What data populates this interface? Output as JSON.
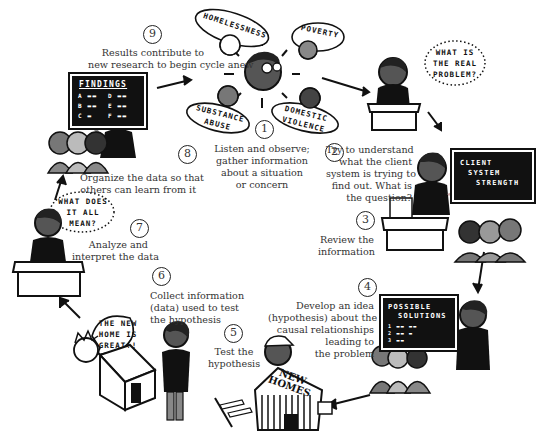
{
  "diagram": {
    "type": "cycle",
    "topic": "research cycle",
    "steps": [
      {
        "number": "1",
        "lines": [
          "Listen and observe;",
          "gather information",
          "about a situation",
          "or concern"
        ]
      },
      {
        "number": "2",
        "lines": [
          "Try to understand",
          "what the client",
          "system is trying to",
          "find out. What is",
          "the question?"
        ]
      },
      {
        "number": "3",
        "lines": [
          "Review the",
          "information"
        ]
      },
      {
        "number": "4",
        "lines": [
          "Develop an idea",
          "(hypothesis) about the",
          "causal relationships",
          "leading to",
          "the problem"
        ]
      },
      {
        "number": "5",
        "lines": [
          "Test the",
          "hypothesis"
        ]
      },
      {
        "number": "6",
        "lines": [
          "Collect information",
          "(data) used to test",
          "the hypothesis"
        ]
      },
      {
        "number": "7",
        "lines": [
          "Analyze and",
          "interpret the data"
        ]
      },
      {
        "number": "8",
        "lines": [
          "Organize the data so that",
          "others can learn from it"
        ]
      },
      {
        "number": "9",
        "lines": [
          "Results contribute to",
          "new research to begin cycle anew"
        ]
      }
    ],
    "concern_bubbles": [
      "HOMELESSNESS",
      "POVERTY",
      "SUBSTANCE ABUSE",
      "DOMESTIC VIOLENCE"
    ],
    "speech_bubbles": {
      "real_problem": [
        "WHAT IS",
        "THE REAL",
        "PROBLEM?"
      ],
      "what_mean": [
        "WHAT DOES",
        "IT ALL",
        "MEAN?"
      ],
      "new_home": [
        "THE NEW",
        "HOME IS",
        "GREAT!!"
      ]
    },
    "boards": {
      "client": [
        "CLIENT",
        "SYSTEM",
        "STRENGTH"
      ],
      "solutions_title": [
        "POSSIBLE",
        "SOLUTIONS"
      ],
      "solutions_items": [
        "1",
        "2",
        "3"
      ],
      "findings_title": "FINDINGS",
      "findings_items": [
        "A",
        "B",
        "C",
        "D",
        "E",
        "F"
      ]
    },
    "house_sign": [
      "NEW",
      "HOMES"
    ],
    "colors": {
      "ink": "#111111",
      "skin_dark": "#555555",
      "skin_mid": "#888888",
      "skin_light": "#bbbbbb",
      "paper": "#ffffff",
      "text": "#333333"
    }
  }
}
